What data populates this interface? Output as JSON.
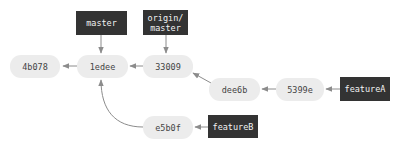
{
  "colors": {
    "node_fill": "#ececec",
    "ref_fill": "#333333",
    "arrow": "#8c8c8c"
  },
  "commits": [
    {
      "id": "4b078",
      "label": "4b078"
    },
    {
      "id": "1edee",
      "label": "1edee"
    },
    {
      "id": "33009",
      "label": "33009"
    },
    {
      "id": "dee6b",
      "label": "dee6b"
    },
    {
      "id": "5399e",
      "label": "5399e"
    },
    {
      "id": "e5b0f",
      "label": "e5b0f"
    }
  ],
  "refs": [
    {
      "id": "master",
      "label": "master",
      "points_to": "1edee"
    },
    {
      "id": "origin-master",
      "label": "origin/\nmaster",
      "points_to": "33009"
    },
    {
      "id": "featureA",
      "label": "featureA",
      "points_to": "5399e"
    },
    {
      "id": "featureB",
      "label": "featureB",
      "points_to": "e5b0f"
    }
  ],
  "edges": [
    {
      "from": "1edee",
      "to": "4b078"
    },
    {
      "from": "33009",
      "to": "1edee"
    },
    {
      "from": "dee6b",
      "to": "33009"
    },
    {
      "from": "5399e",
      "to": "dee6b"
    },
    {
      "from": "e5b0f",
      "to": "1edee"
    }
  ]
}
